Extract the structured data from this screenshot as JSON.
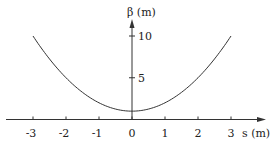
{
  "chart_data": {
    "type": "line",
    "title": "",
    "xlabel": "s (m)",
    "ylabel": "β (m)",
    "xlim": [
      -3.9,
      4.5
    ],
    "ylim": [
      0,
      13
    ],
    "x_ticks": [
      -3,
      -2,
      -1,
      0,
      1,
      2,
      3
    ],
    "x_tick_labels": [
      "-3",
      "-2",
      "-1",
      "0",
      "1",
      "2",
      "3"
    ],
    "y_ticks": [
      5,
      10
    ],
    "y_tick_labels": [
      "5",
      "10"
    ],
    "grid": false,
    "legend": "none",
    "series": [
      {
        "name": "beta",
        "x": [
          -3,
          -2.5,
          -2,
          -1.5,
          -1,
          -0.5,
          0,
          0.5,
          1,
          1.5,
          2,
          2.5,
          3
        ],
        "y": [
          10,
          7.25,
          5,
          3.25,
          2,
          1.25,
          1,
          1.25,
          2,
          3.25,
          5,
          7.25,
          10
        ]
      }
    ]
  }
}
